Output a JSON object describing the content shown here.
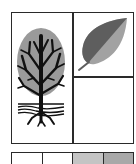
{
  "figure": {
    "panels": [
      {
        "id": "tree",
        "icon": "tree-with-roots-icon"
      },
      {
        "id": "leaf",
        "icon": "leaf-icon"
      },
      {
        "id": "empty",
        "icon": null
      }
    ],
    "strip": {
      "cells": [
        {
          "fill": "#ffffff"
        },
        {
          "fill": "#ffffff"
        },
        {
          "fill": "#c4c4c4"
        },
        {
          "fill": "#a8a8a8"
        }
      ]
    },
    "colors": {
      "line": "#2a2a2a",
      "crown": "#9a9a9a",
      "trunk": "#111111",
      "leaf_dark": "#5e5e5e",
      "leaf_light": "#a2a2a2"
    }
  }
}
